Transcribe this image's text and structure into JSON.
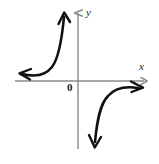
{
  "figure": {
    "kind": "cartesian-graph",
    "background_color": "#ffffff",
    "width": 159,
    "height": 164
  },
  "axes": {
    "color": "#8a8a8a",
    "stroke_width": 1.4,
    "origin": {
      "x": 78,
      "y": 81
    },
    "x_axis": {
      "label": "x",
      "label_position": {
        "x": 139,
        "y": 61
      },
      "start": {
        "x": 15,
        "y": 81
      },
      "end": {
        "x": 147,
        "y": 81
      },
      "arrow": "right"
    },
    "y_axis": {
      "label": "y",
      "label_position": {
        "x": 86,
        "y": 7
      },
      "start": {
        "x": 78,
        "y": 149
      },
      "end": {
        "x": 78,
        "y": 10
      },
      "arrow": "up"
    },
    "origin_label": "0"
  },
  "curve": {
    "color": "#111111",
    "stroke_width": 2.6,
    "description": "hyperbola with branches in quadrant II and quadrant IV",
    "branches": [
      {
        "name": "upper-left-branch",
        "quadrant": "II",
        "path": "M 20 73 C 34 76 45 75 52 67 C 60 58 62 38 64 16",
        "arrow_start": {
          "x": 20,
          "y": 73,
          "direction": "left"
        },
        "arrow_end": {
          "x": 64,
          "y": 13,
          "direction": "up"
        }
      },
      {
        "name": "lower-right-branch",
        "quadrant": "IV",
        "path": "M 95 144 C 97 122 99 104 107 95 C 114 87 126 86 140 88",
        "arrow_start": {
          "x": 95,
          "y": 147,
          "direction": "down"
        },
        "arrow_end": {
          "x": 142,
          "y": 88,
          "direction": "right"
        }
      }
    ]
  }
}
